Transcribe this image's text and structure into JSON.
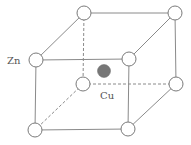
{
  "diagram": {
    "title": "",
    "labels": {
      "corner_atom": "Zn",
      "center_atom": "Cu"
    },
    "colors": {
      "edge": "#8a8a8a",
      "corner_atom_fill": "#ffffff",
      "center_atom_fill": "#777777"
    },
    "corner_atoms": [
      {
        "id": "front-top-left",
        "element": "Zn"
      },
      {
        "id": "front-top-right",
        "element": "Zn"
      },
      {
        "id": "front-bottom-left",
        "element": "Zn"
      },
      {
        "id": "front-bottom-right",
        "element": "Zn"
      },
      {
        "id": "back-top-left",
        "element": "Zn"
      },
      {
        "id": "back-top-right",
        "element": "Zn"
      },
      {
        "id": "back-bottom-left",
        "element": "Zn"
      },
      {
        "id": "back-bottom-right",
        "element": "Zn"
      }
    ],
    "center_atom": {
      "id": "body-center",
      "element": "Cu"
    }
  }
}
